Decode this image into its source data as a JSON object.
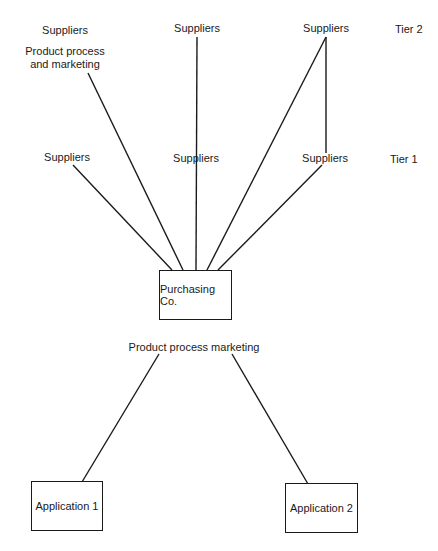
{
  "diagram": {
    "tiers": {
      "tier2": "Tier 2",
      "tier1": "Tier 1"
    },
    "tier2_nodes": [
      {
        "label": "Suppliers"
      },
      {
        "label": "Suppliers"
      },
      {
        "label": "Suppliers"
      }
    ],
    "tier2_annotation": "Product process\nand marketing",
    "tier1_nodes": [
      {
        "label": "Suppliers"
      },
      {
        "label": "Suppliers"
      },
      {
        "label": "Suppliers"
      }
    ],
    "hub": {
      "label": "Purchasing Co."
    },
    "downstream_annotation": "Product process marketing",
    "applications": [
      {
        "label": "Application 1"
      },
      {
        "label": "Application 2"
      }
    ],
    "colors": {
      "line": "#1a1a1a",
      "background": "#ffffff"
    }
  }
}
